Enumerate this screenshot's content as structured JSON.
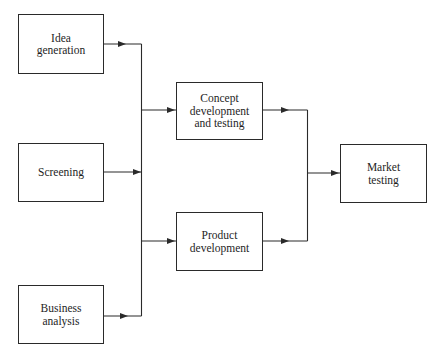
{
  "diagram": {
    "type": "flowchart",
    "colors": {
      "stroke": "#2a2a2a",
      "text": "#1e1e1e",
      "background": "#ffffff"
    },
    "nodes": [
      {
        "id": "idea",
        "label": "Idea\ngeneration"
      },
      {
        "id": "screening",
        "label": "Screening"
      },
      {
        "id": "business",
        "label": "Business\nanalysis"
      },
      {
        "id": "concept",
        "label": "Concept\ndevelopment\nand testing"
      },
      {
        "id": "product",
        "label": "Product\ndevelopment"
      },
      {
        "id": "market",
        "label": "Market\ntesting"
      }
    ],
    "edges": [
      {
        "from": "idea",
        "to": "junction-left"
      },
      {
        "from": "screening",
        "to": "junction-left"
      },
      {
        "from": "business",
        "to": "junction-left"
      },
      {
        "from": "junction-left",
        "to": "concept"
      },
      {
        "from": "junction-left",
        "to": "product"
      },
      {
        "from": "concept",
        "to": "junction-right"
      },
      {
        "from": "product",
        "to": "junction-right"
      },
      {
        "from": "junction-right",
        "to": "market"
      }
    ]
  }
}
